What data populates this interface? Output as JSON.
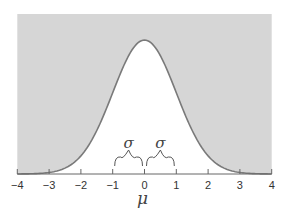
{
  "chart_data": {
    "type": "area",
    "title": "",
    "xlabel": "μ",
    "ylabel": "",
    "xlim": [
      -4,
      4
    ],
    "x_ticks": [
      -4,
      -3,
      -2,
      -1,
      0,
      1,
      2,
      3,
      4
    ],
    "x_tick_labels": [
      "−4",
      "−3",
      "−2",
      "−1",
      "0",
      "1",
      "2",
      "3",
      "4"
    ],
    "series": [
      {
        "name": "normal density",
        "mean": 0,
        "sd": 1,
        "x": [
          -4,
          -3,
          -2,
          -1,
          0,
          1,
          2,
          3,
          4
        ],
        "y_relative": [
          0.0003,
          0.011,
          0.135,
          0.607,
          1.0,
          0.607,
          0.135,
          0.011,
          0.0003
        ]
      }
    ],
    "annotations": [
      {
        "text": "σ",
        "span": [
          -1,
          0
        ],
        "type": "brace"
      },
      {
        "text": "σ",
        "span": [
          0,
          1
        ],
        "type": "brace"
      }
    ],
    "grid": false,
    "legend": null
  },
  "colors": {
    "shade": "#d6d6d6",
    "curve": "#7a7a7a",
    "axis": "#666666"
  },
  "labels": {
    "xlabel": "μ",
    "sigma": "σ"
  }
}
